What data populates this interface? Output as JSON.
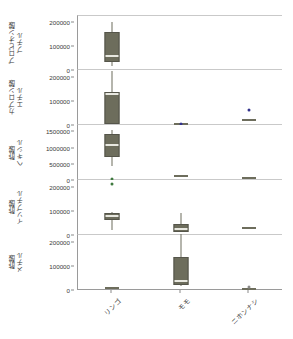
{
  "chart_data": {
    "type": "box",
    "title": "",
    "xlabel": "",
    "ylabel": "",
    "grid": false,
    "legend": "none",
    "categories": [
      "リンゴ",
      "モモ",
      "ニホンナシ"
    ],
    "facets": [
      {
        "label_line1": "プロピオン酸",
        "label_line2": "ブチル",
        "ylim": [
          0,
          230000
        ],
        "yticks": [
          0,
          100000,
          200000
        ],
        "ytick_labels": [
          "0",
          "100000",
          "200000"
        ],
        "boxes": [
          {
            "category": "リンゴ",
            "min": 22000,
            "q1": 48000,
            "median": 62000,
            "q3": 162000,
            "max": 205000,
            "outliers": []
          },
          {
            "category": "モモ",
            "min": 1000,
            "q1": 1500,
            "median": 2000,
            "q3": 2500,
            "max": 3000,
            "outliers": []
          },
          {
            "category": "ニホンナシ",
            "min": 1000,
            "q1": 1500,
            "median": 2000,
            "q3": 2500,
            "max": 3000,
            "outliers": []
          }
        ]
      },
      {
        "label_line1": "カプロン酸",
        "label_line2": "エチル",
        "ylim": [
          0,
          230000
        ],
        "yticks": [
          0,
          100000,
          200000
        ],
        "ytick_labels": [
          "0",
          "100000",
          "200000"
        ],
        "boxes": [
          {
            "category": "リンゴ",
            "min": 8000,
            "q1": 14000,
            "median": 130000,
            "q3": 140000,
            "max": 225000,
            "outliers": []
          },
          {
            "category": "モモ",
            "min": 2000,
            "q1": 3000,
            "median": 5000,
            "q3": 7000,
            "max": 9000,
            "outliers": [
              {
                "value": 6000,
                "color": "#32328c"
              }
            ]
          },
          {
            "category": "ニホンナシ",
            "min": 14000,
            "q1": 18000,
            "median": 22000,
            "q3": 26000,
            "max": 30000,
            "outliers": [
              {
                "value": 62000,
                "color": "#32328c"
              }
            ]
          }
        ]
      },
      {
        "label_line1": "酢酸",
        "label_line2": "ヘキシル",
        "ylim": [
          0,
          1700000
        ],
        "yticks": [
          0,
          500000,
          1000000,
          1500000
        ],
        "ytick_labels": [
          "0",
          "500000",
          "1000000",
          "1500000"
        ],
        "boxes": [
          {
            "category": "リンゴ",
            "min": 430000,
            "q1": 760000,
            "median": 1080000,
            "q3": 1420000,
            "max": 1560000,
            "outliers": [
              {
                "value": 40000,
                "color": "#3f7a3f"
              }
            ]
          },
          {
            "category": "モモ",
            "min": 95000,
            "q1": 110000,
            "median": 130000,
            "q3": 150000,
            "max": 175000,
            "outliers": []
          },
          {
            "category": "ニホンナシ",
            "min": 55000,
            "q1": 62000,
            "median": 70000,
            "q3": 78000,
            "max": 85000,
            "outliers": []
          }
        ]
      },
      {
        "label_line1": "酢酸",
        "label_line2": "イソブチル",
        "ylim": [
          0,
          230000
        ],
        "yticks": [
          0,
          100000,
          200000
        ],
        "ytick_labels": [
          "0",
          "100000",
          "200000"
        ],
        "boxes": [
          {
            "category": "リンゴ",
            "min": 22000,
            "q1": 70000,
            "median": 80000,
            "q3": 92000,
            "max": 95000,
            "outliers": [
              {
                "value": 213000,
                "color": "#3f7a3f"
              }
            ]
          },
          {
            "category": "モモ",
            "min": 14000,
            "q1": 22000,
            "median": 27000,
            "q3": 44000,
            "max": 92000,
            "outliers": []
          },
          {
            "category": "ニホンナシ",
            "min": 26000,
            "q1": 29000,
            "median": 31000,
            "q3": 33000,
            "max": 36000,
            "outliers": []
          }
        ]
      },
      {
        "label_line1": "酢酸",
        "label_line2": "メチル",
        "ylim": [
          0,
          230000
        ],
        "yticks": [
          0,
          100000,
          200000
        ],
        "ytick_labels": [
          "0",
          "100000",
          "200000"
        ],
        "boxes": [
          {
            "category": "リンゴ",
            "min": 3000,
            "q1": 5000,
            "median": 7000,
            "q3": 9000,
            "max": 11000,
            "outliers": []
          },
          {
            "category": "モモ",
            "min": 18000,
            "q1": 28000,
            "median": 38000,
            "q3": 138000,
            "max": 235000,
            "outliers": []
          },
          {
            "category": "ニホンナシ",
            "min": 2000,
            "q1": 3000,
            "median": 4000,
            "q3": 5000,
            "max": 6000,
            "outliers": [
              {
                "value": 14000,
                "color": "#8a8a8a"
              }
            ]
          }
        ]
      }
    ],
    "colors": {
      "box_fill": "#6d6d5c",
      "box_edge": "#55554a",
      "median": "#e8e8e0",
      "outlier_blue": "#32328c",
      "outlier_green": "#3f7a3f",
      "axis": "#9a9a9a"
    }
  }
}
